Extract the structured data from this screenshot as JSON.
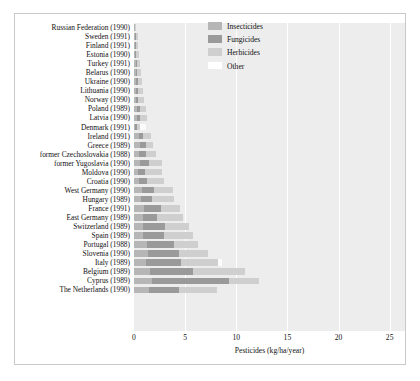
{
  "chart_data": {
    "type": "bar",
    "orientation": "horizontal",
    "stacked": true,
    "title": "",
    "xlabel": "Pesticides (kg/ha/year)",
    "ylabel": "",
    "xlim": [
      0,
      26.5
    ],
    "xticks": [
      0,
      5,
      10,
      15,
      20,
      25
    ],
    "xtick_labels": [
      "0",
      "5",
      "10",
      "15",
      "20",
      "25"
    ],
    "grid": true,
    "grid_axis": "x",
    "legend_position": "top-right",
    "plot_background": "#ededed",
    "series": [
      {
        "name": "Insecticides",
        "color": "#b6b6b6",
        "values": [
          0.05,
          0.12,
          0.1,
          0.12,
          0.15,
          0.18,
          0.2,
          0.22,
          0.18,
          0.3,
          0.32,
          0.12,
          0.45,
          0.55,
          0.5,
          0.6,
          0.4,
          0.45,
          0.8,
          0.7,
          1.0,
          0.85,
          0.9,
          0.9,
          1.3,
          1.4,
          1.2,
          1.6,
          1.8,
          1.5
        ]
      },
      {
        "name": "Fungicides",
        "color": "#9a9a9a",
        "values": [
          0.02,
          0.05,
          0.06,
          0.08,
          0.1,
          0.12,
          0.15,
          0.18,
          0.2,
          0.25,
          0.3,
          0.15,
          0.4,
          0.6,
          0.7,
          0.85,
          0.7,
          0.8,
          1.2,
          1.1,
          1.6,
          1.4,
          2.1,
          2.0,
          2.6,
          3.0,
          3.4,
          4.2,
          7.5,
          2.9
        ]
      },
      {
        "name": "Herbicides",
        "color": "#cfcfcf",
        "values": [
          0.03,
          0.18,
          0.22,
          0.28,
          0.3,
          0.38,
          0.4,
          0.45,
          0.62,
          0.6,
          0.65,
          0.35,
          0.85,
          0.75,
          1.0,
          1.3,
          1.6,
          1.7,
          1.8,
          2.1,
          1.9,
          2.5,
          2.4,
          2.9,
          2.4,
          2.8,
          3.6,
          5.1,
          2.9,
          3.7
        ]
      },
      {
        "name": "Other",
        "color": "#ffffff",
        "values": [
          0.0,
          0.0,
          0.0,
          0.0,
          0.0,
          0.0,
          0.0,
          0.0,
          0.0,
          0.0,
          0.0,
          0.55,
          0.0,
          0.0,
          0.0,
          0.0,
          0.0,
          0.0,
          0.0,
          0.0,
          0.0,
          0.0,
          0.0,
          0.0,
          0.0,
          0.0,
          0.4,
          0.0,
          0.0,
          0.0
        ]
      }
    ],
    "categories": [
      "Russian Federation (1990)",
      "Sweden (1991)",
      "Finland (1991)",
      "Estonia (1990)",
      "Turkey (1991)",
      "Belarus (1990)",
      "Ukraine (1990)",
      "Lithuania (1990)",
      "Norway (1990)",
      "Poland (1989)",
      "Latvia (1990)",
      "Denmark (1991)",
      "Ireland (1991)",
      "Greece (1989)",
      "former Czechoslovakia (1988)",
      "former Yugoslavia (1990)",
      "Moldova (1990)",
      "Croatia (1990)",
      "West Germany (1990)",
      "Hungary (1989)",
      "France (1991)",
      "East Germany (1989)",
      "Switzerland (1989)",
      "Spain (1989)",
      "Portugal (1988)",
      "Slovenia (1990)",
      "Italy (1989)",
      "Belgium (1989)",
      "Cyprus (1989)",
      "The Netherlands (1990)"
    ],
    "totals": [
      0.1,
      0.35,
      0.38,
      0.48,
      0.55,
      0.68,
      0.75,
      0.85,
      1.0,
      1.15,
      1.27,
      1.17,
      1.7,
      1.9,
      2.2,
      2.75,
      2.7,
      2.95,
      3.8,
      3.9,
      4.5,
      4.75,
      5.4,
      5.8,
      6.3,
      7.2,
      8.6,
      10.9,
      12.2,
      8.1
    ]
  },
  "legend": {
    "items": [
      {
        "label": "Insecticides",
        "key": "insecticides"
      },
      {
        "label": "Fungicides",
        "key": "fungicides"
      },
      {
        "label": "Herbicides",
        "key": "herbicides"
      },
      {
        "label": "Other",
        "key": "other"
      }
    ]
  }
}
